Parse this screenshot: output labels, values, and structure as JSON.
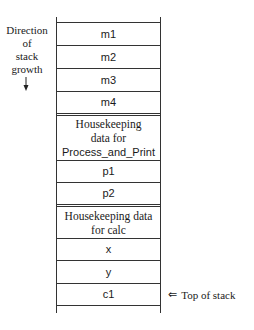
{
  "diagram": {
    "direction_label": [
      "Direction",
      "of",
      "stack",
      "growth"
    ],
    "top_of_stack_label": "Top of stack",
    "top_of_stack_arrow": "⇐",
    "frames": [
      {
        "name": "main",
        "cells": [
          {
            "label": "m1",
            "kind": "variable"
          },
          {
            "label": "m2",
            "kind": "variable"
          },
          {
            "label": "m3",
            "kind": "variable"
          },
          {
            "label": "m4",
            "kind": "variable"
          }
        ]
      },
      {
        "name": "Process_and_Print",
        "cells": [
          {
            "label": "Housekeeping data for Process_and_Print",
            "lines": [
              "Housekeeping",
              "data for",
              "Process_and_Print"
            ],
            "kind": "housekeeping"
          },
          {
            "label": "p1",
            "kind": "variable"
          },
          {
            "label": "p2",
            "kind": "variable"
          }
        ]
      },
      {
        "name": "calc",
        "cells": [
          {
            "label": "Housekeeping data for calc",
            "lines": [
              "Housekeeping data",
              "for calc"
            ],
            "kind": "housekeeping"
          },
          {
            "label": "x",
            "kind": "variable"
          },
          {
            "label": "y",
            "kind": "variable"
          },
          {
            "label": "c1",
            "kind": "variable"
          }
        ]
      }
    ]
  }
}
